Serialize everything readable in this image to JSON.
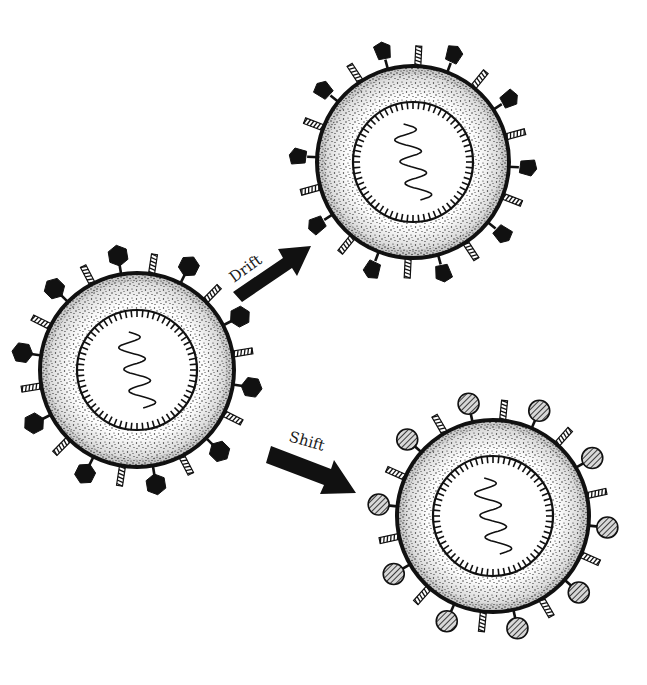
{
  "diagram": {
    "type": "influenza-antigenic-variation",
    "colors": {
      "ink": "#111111",
      "background": "#ffffff",
      "stipple": "#222222"
    },
    "viruses": [
      {
        "id": "original",
        "cx": 137,
        "cy": 370,
        "r_outer": 97,
        "r_inner": 60,
        "antigen_shape": "hexagon",
        "antigen_fill": "solid"
      },
      {
        "id": "drift",
        "cx": 413,
        "cy": 162,
        "r_outer": 96,
        "r_inner": 60,
        "antigen_shape": "pentagon-irregular",
        "antigen_fill": "solid"
      },
      {
        "id": "shift",
        "cx": 493,
        "cy": 516,
        "r_outer": 96,
        "r_inner": 60,
        "antigen_shape": "circle",
        "antigen_fill": "hatched"
      }
    ],
    "arrows": [
      {
        "id": "drift-arrow",
        "label": "Drift",
        "from": [
          237,
          297
        ],
        "to": [
          310,
          247
        ]
      },
      {
        "id": "shift-arrow",
        "label": "Shift",
        "from": [
          268,
          455
        ],
        "to": [
          355,
          493
        ]
      }
    ]
  }
}
